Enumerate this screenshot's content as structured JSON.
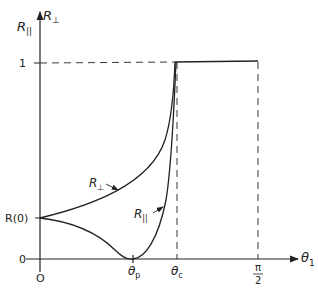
{
  "figure": {
    "y_axis_labels": {
      "parallel": "R",
      "parallel_sub": "||",
      "perp": "R",
      "perp_sub": "⊥"
    },
    "x_axis_label": {
      "main": "θ",
      "sub": "1"
    },
    "y_ticks": {
      "one": "1",
      "r0": "R(0)",
      "zero": "0"
    },
    "x_ticks": {
      "origin": "O",
      "theta_p": "θ",
      "theta_p_sub": "p",
      "theta_c": "θ",
      "theta_c_sub": "c",
      "pi_num": "π",
      "pi_den": "2"
    },
    "curve_labels": {
      "perp": "R",
      "perp_sub": "⊥",
      "parallel": "R",
      "parallel_sub": "||"
    },
    "stroke_color": "#222222"
  }
}
